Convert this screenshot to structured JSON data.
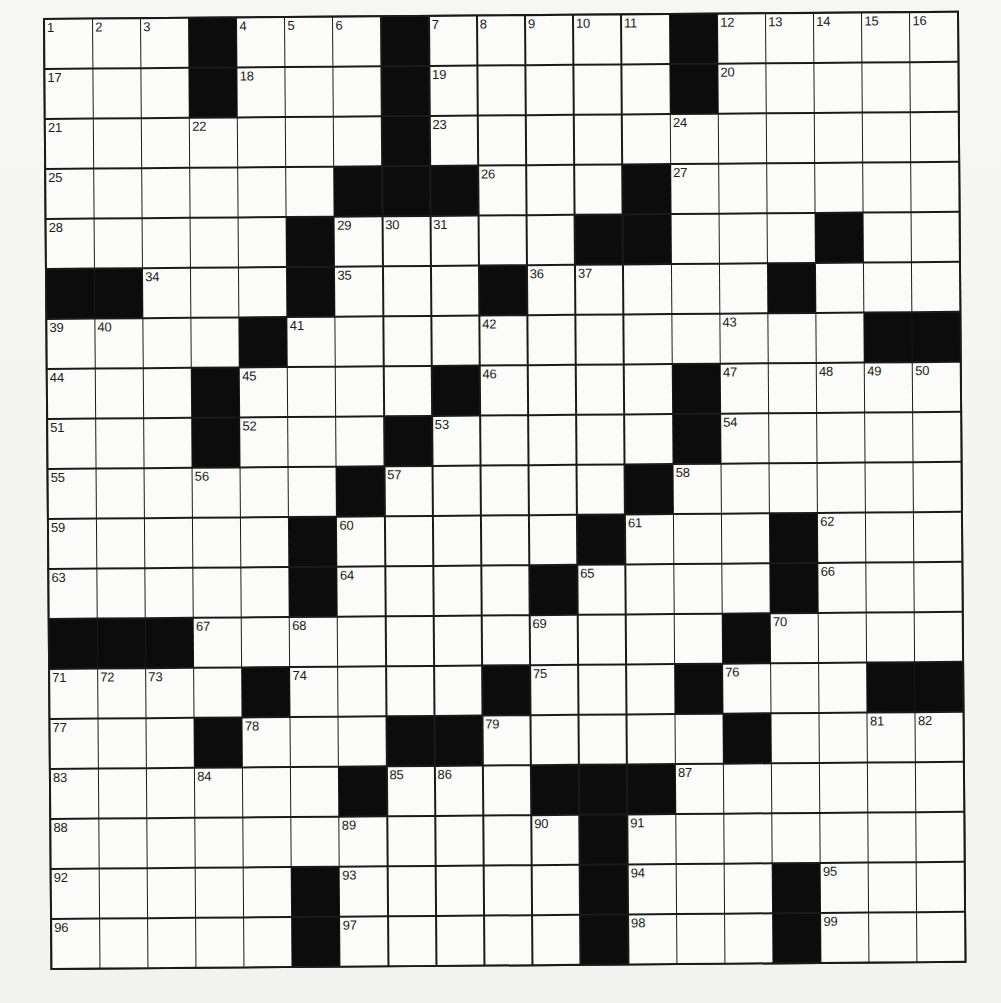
{
  "puzzle": {
    "type": "crossword",
    "rows": 19,
    "cols": 19,
    "layout": [
      "...#...#.....#.....",
      "...#...#.....#.....",
      ".......#...........",
      "......###...#......",
      ".....#.....##...#..",
      "##...#...#.....#...",
      "....#............###",
      "...#....#....#.....",
      "...#...#.....#.....",
      "......#.....#......",
      ".....#.....#...#...",
      ".....#....#....#...",
      "###...........#....",
      "....#....#...#...##",
      "...#...##.....#....",
      "......#...###......",
      "...........#.......",
      ".....#.....#...#...",
      ".....#.....#...#..."
    ],
    "numbers": [
      {
        "r": 1,
        "c": 1,
        "n": "1"
      },
      {
        "r": 1,
        "c": 2,
        "n": "2"
      },
      {
        "r": 1,
        "c": 3,
        "n": "3"
      },
      {
        "r": 1,
        "c": 5,
        "n": "4"
      },
      {
        "r": 1,
        "c": 6,
        "n": "5"
      },
      {
        "r": 1,
        "c": 7,
        "n": "6"
      },
      {
        "r": 1,
        "c": 9,
        "n": "7"
      },
      {
        "r": 1,
        "c": 10,
        "n": "8"
      },
      {
        "r": 1,
        "c": 11,
        "n": "9"
      },
      {
        "r": 1,
        "c": 12,
        "n": "10"
      },
      {
        "r": 1,
        "c": 13,
        "n": "11"
      },
      {
        "r": 1,
        "c": 15,
        "n": "12"
      },
      {
        "r": 1,
        "c": 16,
        "n": "13"
      },
      {
        "r": 1,
        "c": 17,
        "n": "14"
      },
      {
        "r": 1,
        "c": 18,
        "n": "15"
      },
      {
        "r": 1,
        "c": 19,
        "n": "16"
      },
      {
        "r": 2,
        "c": 1,
        "n": "17"
      },
      {
        "r": 2,
        "c": 5,
        "n": "18"
      },
      {
        "r": 2,
        "c": 9,
        "n": "19"
      },
      {
        "r": 2,
        "c": 15,
        "n": "20"
      },
      {
        "r": 3,
        "c": 1,
        "n": "21"
      },
      {
        "r": 3,
        "c": 4,
        "n": "22"
      },
      {
        "r": 3,
        "c": 9,
        "n": "23"
      },
      {
        "r": 3,
        "c": 14,
        "n": "24"
      },
      {
        "r": 4,
        "c": 1,
        "n": "25"
      },
      {
        "r": 4,
        "c": 10,
        "n": "26"
      },
      {
        "r": 4,
        "c": 14,
        "n": "27"
      },
      {
        "r": 5,
        "c": 1,
        "n": "28"
      },
      {
        "r": 5,
        "c": 7,
        "n": "29"
      },
      {
        "r": 5,
        "c": 8,
        "n": "30"
      },
      {
        "r": 5,
        "c": 9,
        "n": "31"
      },
      {
        "r": 5,
        "c": 13,
        "n": "32"
      },
      {
        "r": 5,
        "c": 17,
        "n": "33"
      },
      {
        "r": 6,
        "c": 3,
        "n": "34"
      },
      {
        "r": 6,
        "c": 7,
        "n": "35"
      },
      {
        "r": 6,
        "c": 11,
        "n": "36"
      },
      {
        "r": 6,
        "c": 12,
        "n": "37"
      },
      {
        "r": 6,
        "c": 16,
        "n": "38"
      },
      {
        "r": 7,
        "c": 1,
        "n": "39"
      },
      {
        "r": 7,
        "c": 2,
        "n": "40"
      },
      {
        "r": 7,
        "c": 6,
        "n": "41"
      },
      {
        "r": 7,
        "c": 10,
        "n": "42"
      },
      {
        "r": 7,
        "c": 15,
        "n": "43"
      },
      {
        "r": 8,
        "c": 1,
        "n": "44"
      },
      {
        "r": 8,
        "c": 5,
        "n": "45"
      },
      {
        "r": 8,
        "c": 10,
        "n": "46"
      },
      {
        "r": 8,
        "c": 15,
        "n": "47"
      },
      {
        "r": 8,
        "c": 17,
        "n": "48"
      },
      {
        "r": 8,
        "c": 18,
        "n": "49"
      },
      {
        "r": 8,
        "c": 19,
        "n": "50"
      },
      {
        "r": 9,
        "c": 1,
        "n": "51"
      },
      {
        "r": 9,
        "c": 5,
        "n": "52"
      },
      {
        "r": 9,
        "c": 9,
        "n": "53"
      },
      {
        "r": 9,
        "c": 15,
        "n": "54"
      },
      {
        "r": 10,
        "c": 1,
        "n": "55"
      },
      {
        "r": 10,
        "c": 4,
        "n": "56"
      },
      {
        "r": 10,
        "c": 8,
        "n": "57"
      },
      {
        "r": 10,
        "c": 14,
        "n": "58"
      },
      {
        "r": 11,
        "c": 1,
        "n": "59"
      },
      {
        "r": 11,
        "c": 7,
        "n": "60"
      },
      {
        "r": 11,
        "c": 13,
        "n": "61"
      },
      {
        "r": 11,
        "c": 17,
        "n": "62"
      },
      {
        "r": 12,
        "c": 1,
        "n": "63"
      },
      {
        "r": 12,
        "c": 7,
        "n": "64"
      },
      {
        "r": 12,
        "c": 12,
        "n": "65"
      },
      {
        "r": 12,
        "c": 17,
        "n": "66"
      },
      {
        "r": 13,
        "c": 4,
        "n": "67"
      },
      {
        "r": 13,
        "c": 6,
        "n": "68"
      },
      {
        "r": 13,
        "c": 11,
        "n": "69"
      },
      {
        "r": 13,
        "c": 16,
        "n": "70"
      },
      {
        "r": 14,
        "c": 1,
        "n": "71"
      },
      {
        "r": 14,
        "c": 2,
        "n": "72"
      },
      {
        "r": 14,
        "c": 3,
        "n": "73"
      },
      {
        "r": 14,
        "c": 6,
        "n": "74"
      },
      {
        "r": 14,
        "c": 11,
        "n": "75"
      },
      {
        "r": 14,
        "c": 15,
        "n": "76"
      },
      {
        "r": 15,
        "c": 1,
        "n": "77"
      },
      {
        "r": 15,
        "c": 5,
        "n": "78"
      },
      {
        "r": 15,
        "c": 10,
        "n": "79"
      },
      {
        "r": 15,
        "c": 15,
        "n": "80"
      },
      {
        "r": 15,
        "c": 18,
        "n": "81"
      },
      {
        "r": 15,
        "c": 19,
        "n": "82"
      },
      {
        "r": 16,
        "c": 1,
        "n": "83"
      },
      {
        "r": 16,
        "c": 4,
        "n": "84"
      },
      {
        "r": 16,
        "c": 8,
        "n": "85"
      },
      {
        "r": 16,
        "c": 9,
        "n": "86"
      },
      {
        "r": 16,
        "c": 14,
        "n": "87"
      },
      {
        "r": 17,
        "c": 1,
        "n": "88"
      },
      {
        "r": 17,
        "c": 7,
        "n": "89"
      },
      {
        "r": 17,
        "c": 11,
        "n": "90"
      },
      {
        "r": 17,
        "c": 13,
        "n": "91"
      },
      {
        "r": 18,
        "c": 1,
        "n": "92"
      },
      {
        "r": 18,
        "c": 7,
        "n": "93"
      },
      {
        "r": 18,
        "c": 13,
        "n": "94"
      },
      {
        "r": 18,
        "c": 17,
        "n": "95"
      },
      {
        "r": 19,
        "c": 1,
        "n": "96"
      },
      {
        "r": 19,
        "c": 7,
        "n": "97"
      },
      {
        "r": 19,
        "c": 13,
        "n": "98"
      },
      {
        "r": 19,
        "c": 17,
        "n": "99"
      }
    ],
    "entries": {},
    "colors": {
      "paper": "#f3f3f1",
      "cell": "#fbfbf9",
      "block": "#0c0c0c",
      "line": "#1a1a1a",
      "number": "#1c1c1c"
    }
  }
}
